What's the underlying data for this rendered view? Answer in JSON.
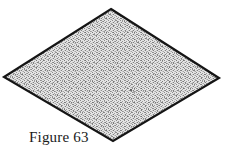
{
  "page": {
    "background_color": "#ffffff",
    "width": 227,
    "height": 152
  },
  "figure": {
    "name": "rhombus-figure",
    "shape_type": "rhombus",
    "outline_color": "#151515",
    "outline_width": 2.2,
    "fill_description": "fine stipple dither pattern",
    "fill_color": "#d8d8d8",
    "stipple_dot_color": "#6e6e6e",
    "vertices": [
      {
        "label": "top",
        "x": 111,
        "y": 9
      },
      {
        "label": "right",
        "x": 219,
        "y": 78
      },
      {
        "label": "bottom",
        "x": 113,
        "y": 141
      },
      {
        "label": "left",
        "x": 4,
        "y": 77
      }
    ],
    "marks": [
      {
        "label": "speck",
        "x": 131,
        "y": 90,
        "r": 1.1,
        "color": "#4a4a4a"
      },
      {
        "label": "speck",
        "x": 134,
        "y": 92,
        "r": 0.8,
        "color": "#5a5a5a"
      },
      {
        "label": "speck",
        "x": 97,
        "y": 101,
        "r": 0.7,
        "color": "#777777"
      }
    ]
  },
  "caption": {
    "text": "Figure 63",
    "color": "#1a1a1a"
  }
}
